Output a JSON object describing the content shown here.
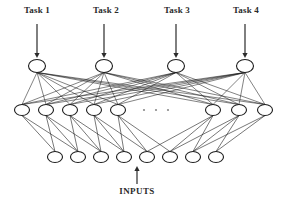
{
  "diagram": {
    "background_color": "#ffffff",
    "stroke_color": "#1c1c1c",
    "text_color": "#2b2b2b",
    "width": 281,
    "height": 211
  },
  "task_labels": [
    {
      "text": "Task 1",
      "x": 37,
      "y": 11
    },
    {
      "text": "Task 2",
      "x": 106,
      "y": 11
    },
    {
      "text": "Task 3",
      "x": 177,
      "y": 11
    },
    {
      "text": "Task 4",
      "x": 246,
      "y": 11
    }
  ],
  "inputs_label": {
    "text": "INPUTS",
    "x": 137,
    "y": 192
  },
  "layers": {
    "output": {
      "name": "output-layer",
      "count": 4,
      "cy": 66,
      "rx": 8.5,
      "ry": 6.5,
      "x_positions": [
        37,
        104,
        176,
        245
      ]
    },
    "hidden": {
      "name": "hidden-layer",
      "count": 8,
      "cy": 110,
      "rx": 7.5,
      "ry": 5.5,
      "x_positions": [
        22,
        46,
        70,
        94,
        118,
        213,
        239,
        265
      ],
      "ellipsis_dots_x": [
        144,
        156,
        168
      ],
      "ellipsis_dots_y": 110
    },
    "input": {
      "name": "input-layer",
      "count": 8,
      "cy": 157,
      "rx": 7.5,
      "ry": 5.5,
      "x_positions": [
        55,
        78,
        101,
        124,
        147,
        170,
        193,
        216
      ]
    }
  },
  "task_arrows": [
    {
      "x": 37,
      "y_start": 24,
      "y_end": 58
    },
    {
      "x": 104,
      "y_start": 24,
      "y_end": 58
    },
    {
      "x": 176,
      "y_start": 24,
      "y_end": 58
    },
    {
      "x": 245,
      "y_start": 24,
      "y_end": 58
    }
  ],
  "inputs_arrow": {
    "x": 137,
    "y_start": 184,
    "y_end": 166
  },
  "connections": {
    "output_to_hidden": "fully-connected",
    "hidden_to_input": "sparse-crossing"
  }
}
